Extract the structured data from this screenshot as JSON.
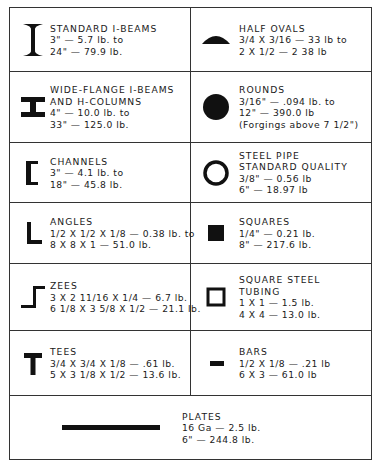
{
  "rows": [
    {
      "left": {
        "icon": "standard-i-beam-icon",
        "title": "STANDARD I-BEAMS",
        "lines": [
          "3\" — 5.7 lb. to",
          "24\" — 79.9 lb."
        ]
      },
      "right": {
        "icon": "half-oval-icon",
        "title": "HALF OVALS",
        "lines": [
          "3/4 X 3/16 — 33 lb to",
          "2 X 1/2 — 2 38 lb"
        ]
      }
    },
    {
      "left": {
        "icon": "wide-flange-beam-icon",
        "title": "WIDE-FLANGE I-BEAMS",
        "title2": "AND H-COLUMNS",
        "lines": [
          "4\" — 10.0 lb. to",
          "33\" — 125.0 lb."
        ]
      },
      "right": {
        "icon": "round-bar-icon",
        "title": "ROUNDS",
        "lines": [
          "3/16\" — .094 lb. to",
          "12\" — 390.0 lb",
          "(Forgings above 7 1/2\")"
        ]
      }
    },
    {
      "left": {
        "icon": "channel-icon",
        "title": "CHANNELS",
        "lines": [
          "3\" — 4.1 lb. to",
          "18\" — 45.8 lb."
        ]
      },
      "right": {
        "icon": "steel-pipe-icon",
        "title": "STEEL PIPE",
        "title2": "STANDARD QUALITY",
        "lines": [
          "3/8\" — 0.56 lb",
          "6\" — 18.97 lb"
        ]
      }
    },
    {
      "left": {
        "icon": "angle-icon",
        "title": "ANGLES",
        "lines": [
          "1/2 X 1/2 X 1/8 — 0.38 lb. to",
          "8 X 8 X 1 — 51.0 lb."
        ]
      },
      "right": {
        "icon": "square-bar-icon",
        "title": "SQUARES",
        "lines": [
          "1/4\" — 0.21 lb.",
          "8\" — 217.6 lb."
        ]
      }
    },
    {
      "left": {
        "icon": "zee-icon",
        "title": "ZEES",
        "lines": [
          "3 X 2 11/16 X 1/4 — 6.7 lb.",
          "6 1/8 X 3 5/8 X 1/2 — 21.1 lb."
        ]
      },
      "right": {
        "icon": "square-tubing-icon",
        "title": "SQUARE STEEL",
        "title2": "TUBING",
        "lines": [
          "1 X 1 — 1.5 lb.",
          "4 X 4 — 13.0 lb."
        ]
      }
    },
    {
      "left": {
        "icon": "tee-icon",
        "title": "TEES",
        "lines": [
          "3/4 X 3/4 X 1/8 — .61 lb.",
          "5 X 3 1/8 X 1/2 — 13.6 lb."
        ]
      },
      "right": {
        "icon": "flat-bar-icon",
        "title": "BARS",
        "lines": [
          "1/2 X 1/8 — .21 lb",
          "6 X 3 — 61.0 lb"
        ]
      }
    }
  ],
  "plates": {
    "icon": "plate-icon",
    "title": "PLATES",
    "lines": [
      "16 Ga — 2.5 lb.",
      "6\" — 244.8 lb."
    ]
  }
}
